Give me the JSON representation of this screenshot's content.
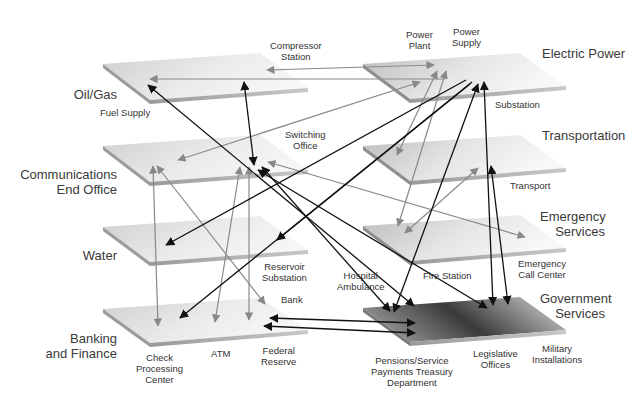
{
  "sectors": {
    "oil_gas": "Oil/Gas",
    "communications": [
      "Communications",
      "End Office"
    ],
    "water": "Water",
    "banking": [
      "Banking",
      "and Finance"
    ],
    "electric": "Electric Power",
    "transportation": "Transportation",
    "emergency": [
      "Emergency",
      "Services"
    ],
    "government": [
      "Government",
      "Services"
    ]
  },
  "nodes": {
    "fuel_supply": "Fuel Supply",
    "compressor_station": [
      "Compressor",
      "Station"
    ],
    "switching_office": [
      "Switching",
      "Office"
    ],
    "reservoir_substation": [
      "Reservoir",
      "Substation"
    ],
    "bank": "Bank",
    "check_processing_center": [
      "Check",
      "Processing",
      "Center"
    ],
    "atm": "ATM",
    "federal_reserve": [
      "Federal",
      "Reserve"
    ],
    "power_plant": [
      "Power",
      "Plant"
    ],
    "power_supply": [
      "Power",
      "Supply"
    ],
    "substation": "Substation",
    "transport": "Transport",
    "hospital_ambulance": [
      "Hospital",
      "Ambulance"
    ],
    "fire_station": "Fire Station",
    "emergency_call_center": [
      "Emergency",
      "Call Center"
    ],
    "pensions": [
      "Pensions/Service",
      "Payments Treasury",
      "Department"
    ],
    "legislative_offices": [
      "Legislative",
      "Offices"
    ],
    "military_installations": [
      "Military",
      "Installations"
    ]
  },
  "colors": {
    "plane_light": "#f2f2f2",
    "plane_mid": "#c8c8c8",
    "plane_dark": "#4a4a4a",
    "plane_edge": "#a8a8a8",
    "arrow_black": "#111111",
    "arrow_gray": "#8a8a8a"
  }
}
